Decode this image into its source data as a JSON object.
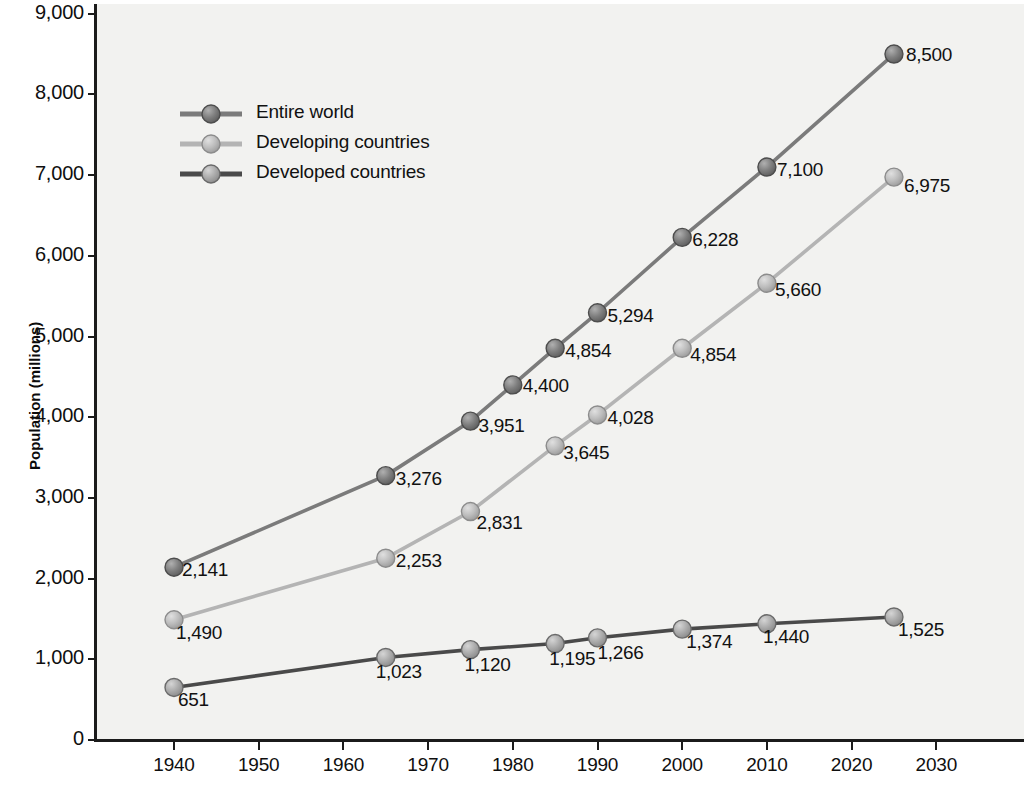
{
  "chart_data": {
    "type": "line",
    "title": "",
    "xlabel": "",
    "ylabel": "Population (millions)",
    "xlim": [
      1935,
      2035
    ],
    "ylim": [
      0,
      9000
    ],
    "grid": false,
    "legend_position": "upper-left inside plot",
    "x_ticks": [
      "1940",
      "1950",
      "1960",
      "1970",
      "1980",
      "1990",
      "2000",
      "2010",
      "2020",
      "2030"
    ],
    "y_ticks": [
      "0",
      "1,000",
      "2,000",
      "3,000",
      "4,000",
      "5,000",
      "6,000",
      "7,000",
      "8,000",
      "9,000"
    ],
    "series": [
      {
        "name": "Entire world",
        "color": "#7b7b7b",
        "x": [
          1940,
          1965,
          1975,
          1980,
          1985,
          1990,
          2000,
          2010,
          2025
        ],
        "values": [
          2141,
          3276,
          3951,
          4400,
          4854,
          5294,
          6228,
          7100,
          8500
        ],
        "labels": [
          "2,141",
          "3,276",
          "3,951",
          "4,400",
          "4,854",
          "5,294",
          "6,228",
          "7,100",
          "8,500"
        ]
      },
      {
        "name": "Developing countries",
        "color": "#b4b4b4",
        "x": [
          1940,
          1965,
          1975,
          1985,
          1990,
          2000,
          2010,
          2025
        ],
        "values": [
          1490,
          2253,
          2831,
          3645,
          4028,
          4854,
          5660,
          6975
        ],
        "labels": [
          "1,490",
          "2,253",
          "2,831",
          "3,645",
          "4,028",
          "4,854",
          "5,660",
          "6,975"
        ]
      },
      {
        "name": "Developed countries",
        "color": "#4a4a4a",
        "x": [
          1940,
          1965,
          1975,
          1985,
          1990,
          2000,
          2010,
          2025
        ],
        "values": [
          651,
          1023,
          1120,
          1195,
          1266,
          1374,
          1440,
          1525
        ],
        "labels": [
          "651",
          "1,023",
          "1,120",
          "1,195",
          "1,266",
          "1,374",
          "1,440",
          "1,525"
        ]
      }
    ]
  },
  "axes": {
    "y_title": "Population (millions)",
    "y_ticks": [
      "9,000",
      "8,000",
      "7,000",
      "6,000",
      "5,000",
      "4,000",
      "3,000",
      "2,000",
      "1,000",
      "0"
    ],
    "x_ticks": [
      "1940",
      "1950",
      "1960",
      "1970",
      "1980",
      "1990",
      "2000",
      "2010",
      "2020",
      "2030"
    ]
  },
  "legend": {
    "items": [
      {
        "label": "Entire world",
        "color": "#7b7b7b"
      },
      {
        "label": "Developing countries",
        "color": "#b4b4b4"
      },
      {
        "label": "Developed countries",
        "color": "#4a4a4a"
      }
    ]
  },
  "colors": {
    "plot_background": "#f2f2f0",
    "page_background": "#ffffff",
    "axis": "#1b1b1b",
    "text": "#111111",
    "entire_world": "#7b7b7b",
    "developing": "#b4b4b4",
    "developed": "#4a4a4a"
  }
}
